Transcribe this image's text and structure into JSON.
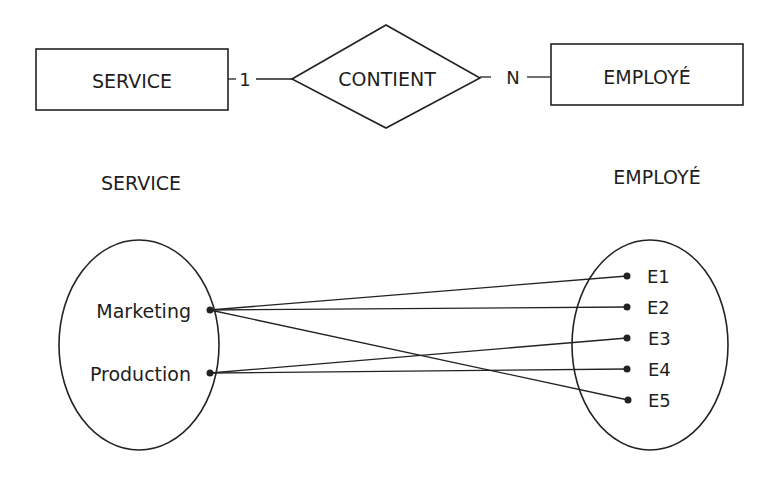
{
  "er_model": {
    "entity_left": {
      "label": "SERVICE",
      "box": [
        36,
        49,
        192,
        61
      ]
    },
    "relationship": {
      "label": "CONTIENT",
      "points": "292,79 386,25 480,78 386,128"
    },
    "entity_right": {
      "label": "EMPLOYÉ",
      "box": [
        551,
        44,
        192,
        61
      ]
    },
    "cardinality_left": "1",
    "cardinality_right": "N"
  },
  "instances": {
    "left_set": {
      "title": "SERVICE",
      "ellipse": {
        "cx": 139,
        "cy": 345,
        "rx": 80,
        "ry": 105
      },
      "items": [
        {
          "label": "Marketing",
          "x": 210,
          "y": 310
        },
        {
          "label": "Production",
          "x": 210,
          "y": 373
        }
      ]
    },
    "right_set": {
      "title": "EMPLOYÉ",
      "ellipse": {
        "cx": 650,
        "cy": 345,
        "rx": 78,
        "ry": 105
      },
      "items": [
        {
          "label": "E1",
          "x": 627,
          "y": 276
        },
        {
          "label": "E2",
          "x": 627,
          "y": 307
        },
        {
          "label": "E3",
          "x": 627,
          "y": 338
        },
        {
          "label": "E4",
          "x": 627,
          "y": 369
        },
        {
          "label": "E5",
          "x": 628,
          "y": 400
        }
      ]
    },
    "links": [
      {
        "from": "Marketing",
        "to": "E1"
      },
      {
        "from": "Marketing",
        "to": "E2"
      },
      {
        "from": "Marketing",
        "to": "E5"
      },
      {
        "from": "Production",
        "to": "E3"
      },
      {
        "from": "Production",
        "to": "E4"
      }
    ]
  }
}
